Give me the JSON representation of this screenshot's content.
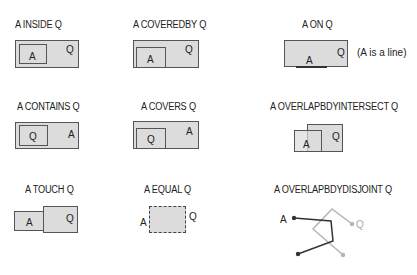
{
  "diagram": {
    "relations": [
      {
        "id": "inside",
        "title": "A INSIDE Q",
        "labels": {
          "a": "A",
          "q": "Q"
        }
      },
      {
        "id": "coveredby",
        "title": "A COVEREDBY Q",
        "labels": {
          "a": "A",
          "q": "Q"
        }
      },
      {
        "id": "on",
        "title": "A ON Q",
        "labels": {
          "a": "A",
          "q": "Q"
        },
        "note": "(A is a line)"
      },
      {
        "id": "contains",
        "title": "A CONTAINS Q",
        "labels": {
          "a": "A",
          "q": "Q"
        }
      },
      {
        "id": "covers",
        "title": "A COVERS Q",
        "labels": {
          "a": "A",
          "q": "Q"
        }
      },
      {
        "id": "overlapbdyintersect",
        "title": "A OVERLAPBDYINTERSECT Q",
        "labels": {
          "a": "A",
          "q": "Q"
        }
      },
      {
        "id": "touch",
        "title": "A TOUCH Q",
        "labels": {
          "a": "A",
          "q": "Q"
        }
      },
      {
        "id": "equal",
        "title": "A EQUAL Q",
        "labels": {
          "a": "A",
          "q": "Q"
        }
      },
      {
        "id": "overlapbdydisjoint",
        "title": "A OVERLAPBDYDISJOINT Q",
        "labels": {
          "a": "A",
          "q": "Q"
        }
      }
    ],
    "colors": {
      "fill": "#dcdcdc",
      "stroke": "#555555",
      "line_dark": "#333333",
      "line_light": "#b5b5b5"
    }
  }
}
